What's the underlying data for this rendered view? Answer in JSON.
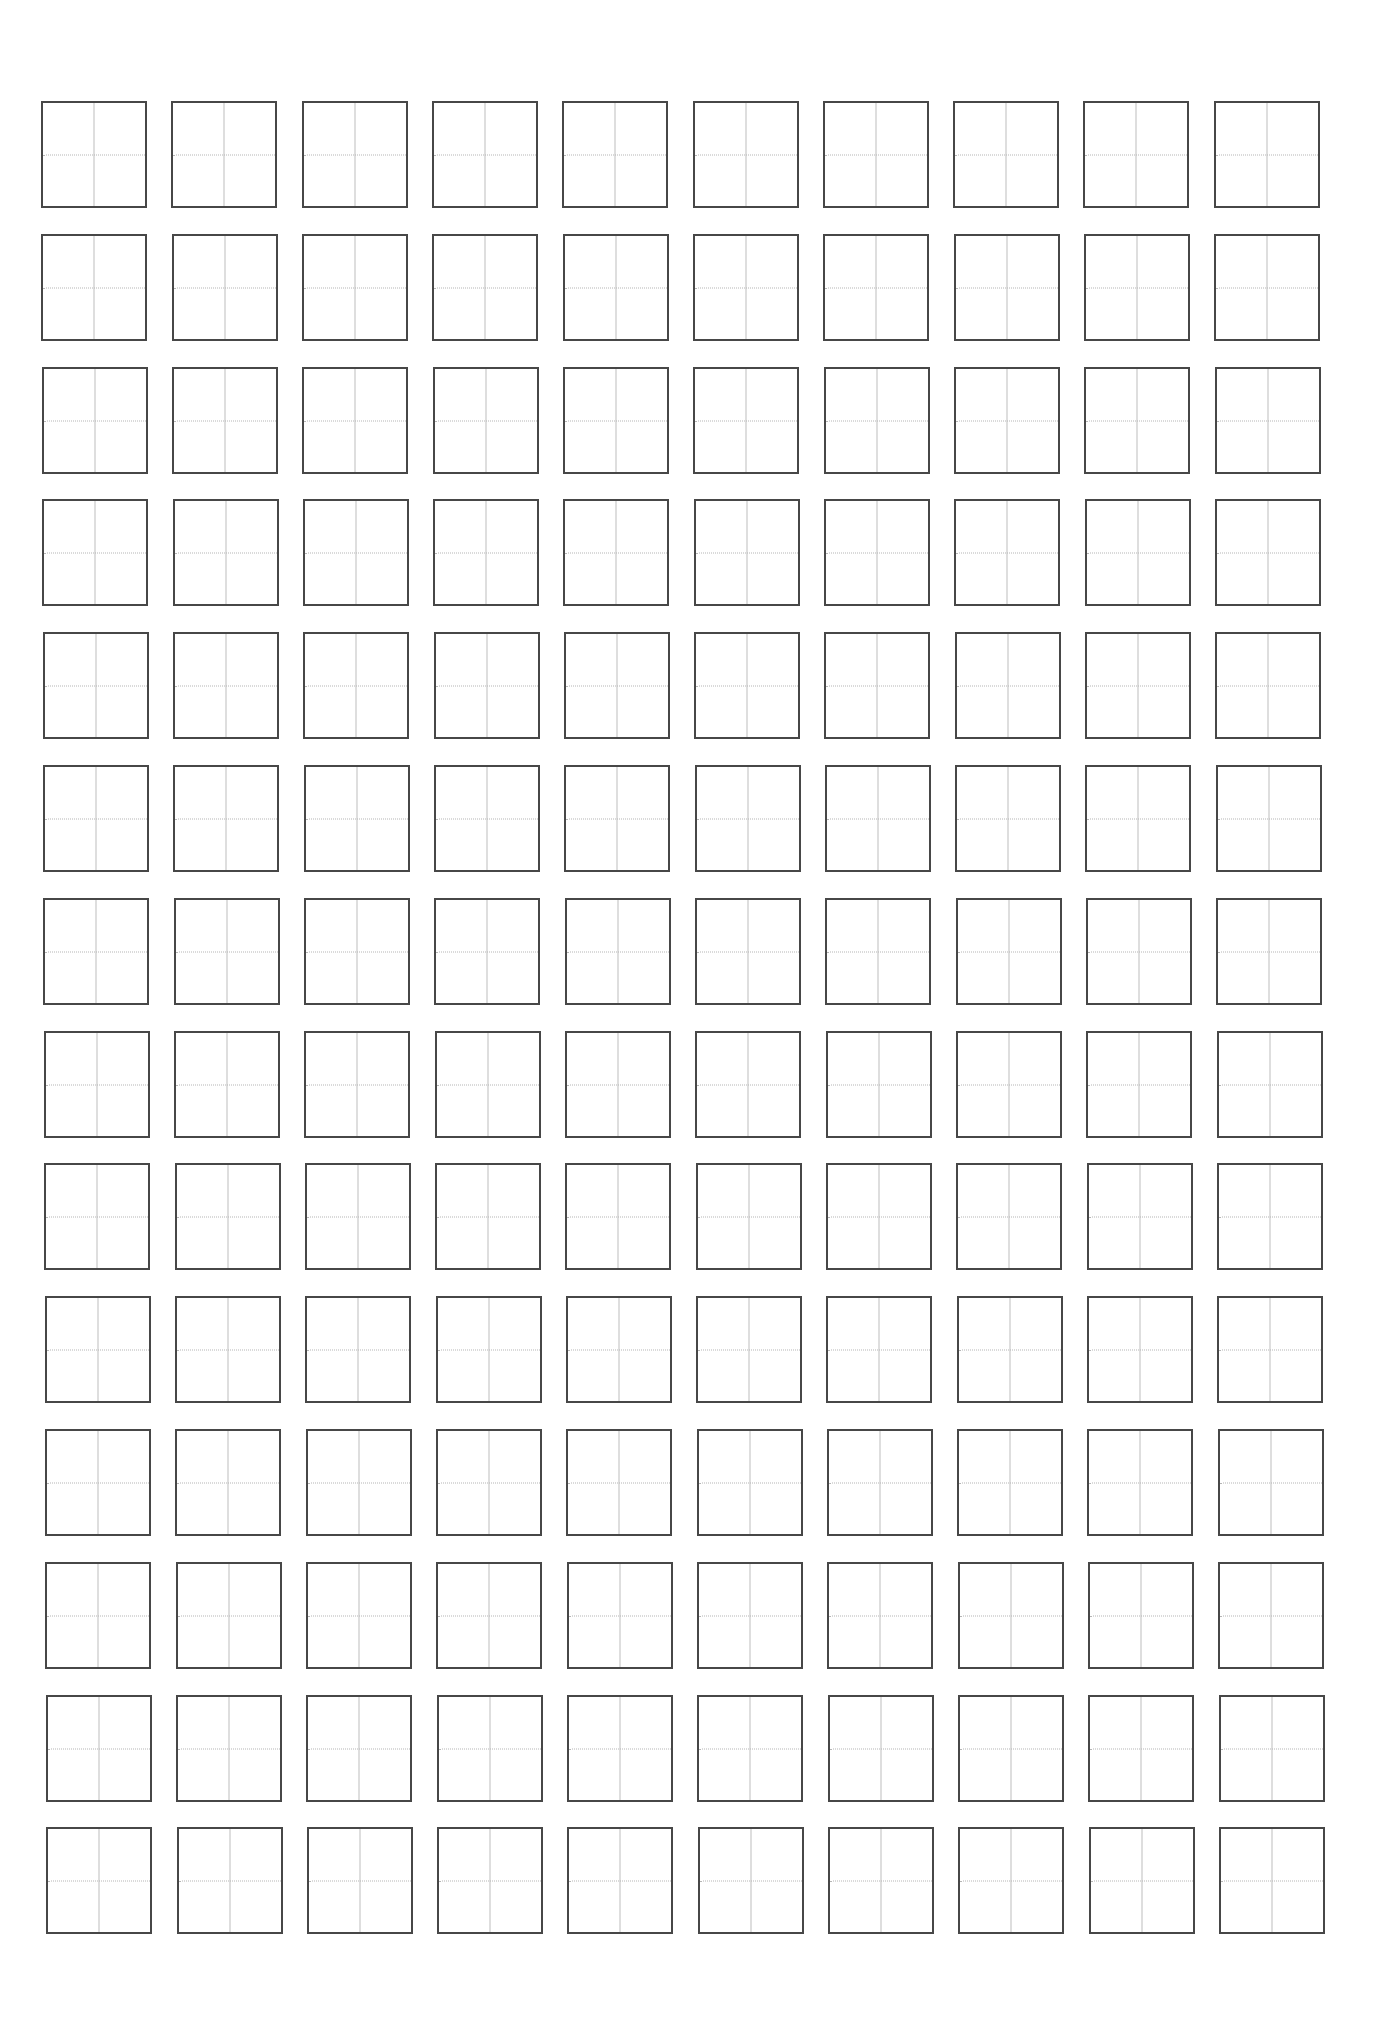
{
  "page": {
    "type": "character-practice-grid",
    "background": "#ffffff"
  },
  "grid": {
    "rows": 14,
    "columns": 10,
    "cell_style": "cross-grid",
    "colors": {
      "border": "#474747",
      "center_vertical_line": "#bdbdbd",
      "center_horizontal_line_dotted": "#b5b5b5"
    },
    "layout": {
      "origin_x": 41,
      "origin_y": 101,
      "cell_width": 106,
      "cell_height": 107,
      "column_pitch": 130.3,
      "row_pitch": 132.8,
      "row_x_drift": 0.4
    }
  }
}
